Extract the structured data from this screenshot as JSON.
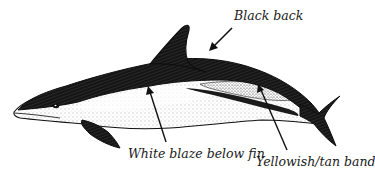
{
  "diagram": {
    "colors": {
      "ink": "#111111",
      "background": "#ffffff",
      "stipple": "#444444"
    },
    "labels": [
      {
        "id": "black-back",
        "text": "Black back"
      },
      {
        "id": "white-blaze",
        "text": "White blaze below fin"
      },
      {
        "id": "tan-band",
        "text": "Yellowish/tan band"
      }
    ]
  }
}
